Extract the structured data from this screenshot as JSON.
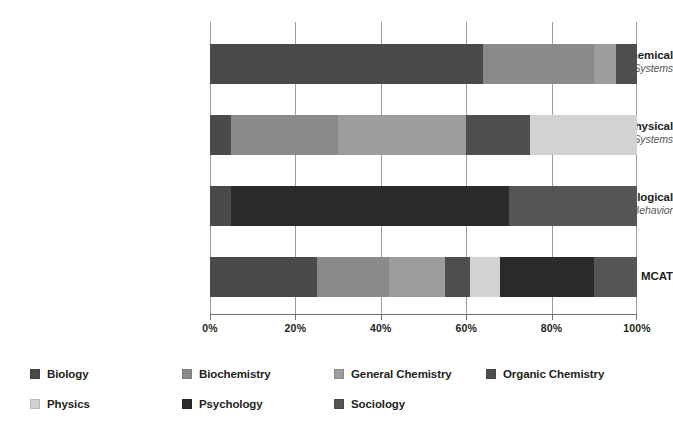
{
  "chart_data": {
    "type": "bar",
    "orientation": "horizontal",
    "stacked": true,
    "normalized_percent": true,
    "title": "",
    "subtitle": "",
    "xlabel": "",
    "ylabel": "",
    "xlim": [
      0,
      100
    ],
    "xticks": [
      0,
      20,
      40,
      60,
      80,
      100
    ],
    "xtick_labels": [
      "0%",
      "20%",
      "40%",
      "60%",
      "80%",
      "100%"
    ],
    "grid": true,
    "grid_axis": "x",
    "legend_position": "bottom",
    "categories": [
      "Biological and Biochemical",
      "Chemical and Physical",
      "Psychological, Social, and Biological",
      "MCAT"
    ],
    "category_labels": [
      {
        "main": "Biological and Biochemical",
        "sub": "Foundations of Living Systems"
      },
      {
        "main": "Chemical and Physical",
        "sub": "Foundations of Biological Systems"
      },
      {
        "main": "Psychological, Social, and Biological",
        "sub": "Foundations of Behavior"
      },
      {
        "main": "MCAT",
        "sub": ""
      }
    ],
    "series": [
      {
        "name": "Biology",
        "color": "#4a4a4a",
        "values": [
          64,
          5,
          5,
          25
        ]
      },
      {
        "name": "Biochemistry",
        "color": "#8a8a8a",
        "values": [
          26,
          25,
          0,
          17
        ]
      },
      {
        "name": "General Chemistry",
        "color": "#9d9d9d",
        "values": [
          5,
          30,
          0,
          13
        ]
      },
      {
        "name": "Organic Chemistry",
        "color": "#4e4e4e",
        "values": [
          5,
          15,
          0,
          6
        ]
      },
      {
        "name": "Physics",
        "color": "#d2d2d2",
        "values": [
          0,
          25,
          0,
          7
        ]
      },
      {
        "name": "Psychology",
        "color": "#2b2b2b",
        "values": [
          0,
          0,
          65,
          22
        ]
      },
      {
        "name": "Sociology",
        "color": "#555555",
        "values": [
          0,
          0,
          30,
          10
        ]
      }
    ]
  },
  "legend": {
    "items": [
      {
        "label": "Biology",
        "color": "#4a4a4a"
      },
      {
        "label": "Biochemistry",
        "color": "#8a8a8a"
      },
      {
        "label": "General Chemistry",
        "color": "#9d9d9d"
      },
      {
        "label": "Organic Chemistry",
        "color": "#4e4e4e"
      },
      {
        "label": "Physics",
        "color": "#d2d2d2"
      },
      {
        "label": "Psychology",
        "color": "#2b2b2b"
      },
      {
        "label": "Sociology",
        "color": "#555555"
      }
    ]
  },
  "colors": {
    "background": "#ffffff",
    "text": "#231f20",
    "subtext": "#58585a",
    "gridline": "#9b9b9b",
    "axis": "#6f6f6f"
  }
}
